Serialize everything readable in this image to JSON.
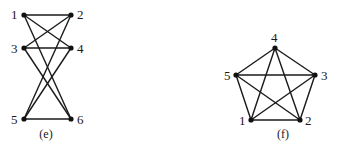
{
  "figure": {
    "graphs": [
      {
        "id": "e",
        "caption": "(e)",
        "caption_pos": [
          46,
          138
        ],
        "vertices": [
          {
            "label": "1",
            "x": 24,
            "y": 15,
            "lx": 11,
            "ly": 19
          },
          {
            "label": "2",
            "x": 71,
            "y": 15,
            "lx": 77,
            "ly": 19
          },
          {
            "label": "3",
            "x": 24,
            "y": 48,
            "lx": 11,
            "ly": 53
          },
          {
            "label": "4",
            "x": 71,
            "y": 48,
            "lx": 77,
            "ly": 53
          },
          {
            "label": "5",
            "x": 24,
            "y": 119,
            "lx": 11,
            "ly": 124
          },
          {
            "label": "6",
            "x": 71,
            "y": 119,
            "lx": 77,
            "ly": 124
          }
        ],
        "edges": [
          [
            "1",
            "2"
          ],
          [
            "1",
            "4"
          ],
          [
            "1",
            "6"
          ],
          [
            "2",
            "3"
          ],
          [
            "2",
            "5"
          ],
          [
            "3",
            "4"
          ],
          [
            "3",
            "6"
          ],
          [
            "4",
            "5"
          ],
          [
            "5",
            "6"
          ]
        ]
      },
      {
        "id": "f",
        "caption": "(f)",
        "caption_pos": [
          283,
          138
        ],
        "vertices": [
          {
            "label": "1",
            "x": 251,
            "y": 120,
            "lx": 239,
            "ly": 125
          },
          {
            "label": "2",
            "x": 300,
            "y": 120,
            "lx": 305,
            "ly": 125
          },
          {
            "label": "3",
            "x": 315,
            "y": 75,
            "lx": 321,
            "ly": 80
          },
          {
            "label": "4",
            "x": 275,
            "y": 48,
            "lx": 271,
            "ly": 42
          },
          {
            "label": "5",
            "x": 236,
            "y": 75,
            "lx": 224,
            "ly": 80
          }
        ],
        "edges": [
          [
            "1",
            "2"
          ],
          [
            "1",
            "3"
          ],
          [
            "1",
            "4"
          ],
          [
            "1",
            "5"
          ],
          [
            "2",
            "3"
          ],
          [
            "2",
            "4"
          ],
          [
            "2",
            "5"
          ],
          [
            "3",
            "4"
          ],
          [
            "3",
            "5"
          ],
          [
            "4",
            "5"
          ]
        ]
      }
    ]
  }
}
